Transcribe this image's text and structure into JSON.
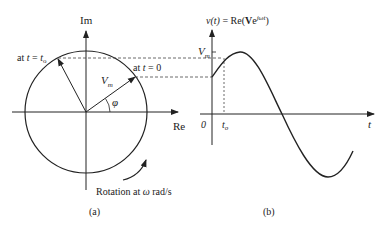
{
  "diagram": {
    "panel_a": {
      "caption": "(a)",
      "axis_im_label": "Im",
      "axis_re_label": "Re",
      "vector_t0_label_prefix": "at ",
      "vector_t0_label_var": "t",
      "vector_t0_label_suffix": " = 0",
      "vector_to_label_prefix": "at ",
      "vector_to_label_var": "t",
      "vector_to_label_eq": " = ",
      "vector_to_label_t": "t",
      "vector_to_label_sub": "o",
      "magnitude_label": "V",
      "magnitude_sub": "m",
      "angle_label": "φ",
      "rotation_label_prefix": "Rotation at ",
      "rotation_omega": "ω",
      "rotation_label_suffix": " rad/s"
    },
    "panel_b": {
      "caption": "(b)",
      "title_v": "v",
      "title_paren_t": "(t)",
      "title_eq": " = Re(",
      "title_bold_v": "V",
      "title_e": "e",
      "title_exp": "jωt",
      "title_close": ")",
      "peak_label": "V",
      "peak_sub": "m",
      "origin_label": "0",
      "to_label": "t",
      "to_sub": "o",
      "t_axis_label": "t"
    },
    "colors": {
      "line": "#222222",
      "dashed": "#444444"
    }
  }
}
